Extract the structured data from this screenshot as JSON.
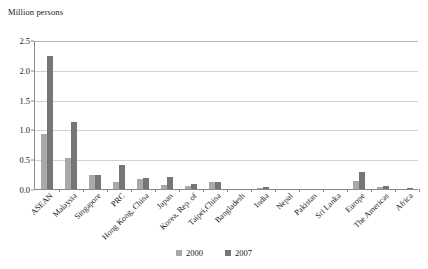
{
  "chart_data": {
    "type": "bar",
    "title": "",
    "subtitle": "",
    "ylabel": "Million persons",
    "xlabel": "",
    "ylim": [
      0,
      2.5
    ],
    "yticks": [
      "0.0",
      "0.5",
      "1.0",
      "1.5",
      "2.0",
      "2.5"
    ],
    "ytick_values": [
      0.0,
      0.5,
      1.0,
      1.5,
      2.0,
      2.5
    ],
    "grid": true,
    "legend_position": "bottom",
    "categories": [
      "ASEAN",
      "Malaysia",
      "Singapore",
      "PRC",
      "Hong Kong, China",
      "Japan",
      "Korea, Rep. of",
      "Taipei,China",
      "Bangladesh",
      "India",
      "Nepal",
      "Pakistan",
      "Sri Lanka",
      "Europe",
      "The Americas",
      "Africa"
    ],
    "series": [
      {
        "name": "2000",
        "color": "#a9a9a9",
        "values": [
          0.92,
          0.52,
          0.23,
          0.12,
          0.17,
          0.07,
          0.05,
          0.11,
          0.0,
          0.01,
          0.0,
          0.0,
          0.0,
          0.13,
          0.03,
          0.0
        ]
      },
      {
        "name": "2007",
        "color": "#767676",
        "values": [
          2.24,
          1.13,
          0.24,
          0.4,
          0.18,
          0.2,
          0.09,
          0.12,
          0.0,
          0.04,
          0.0,
          0.0,
          0.0,
          0.28,
          0.05,
          0.01
        ]
      }
    ]
  },
  "legend": {
    "items": [
      {
        "label": "2000"
      },
      {
        "label": "2007"
      }
    ]
  }
}
